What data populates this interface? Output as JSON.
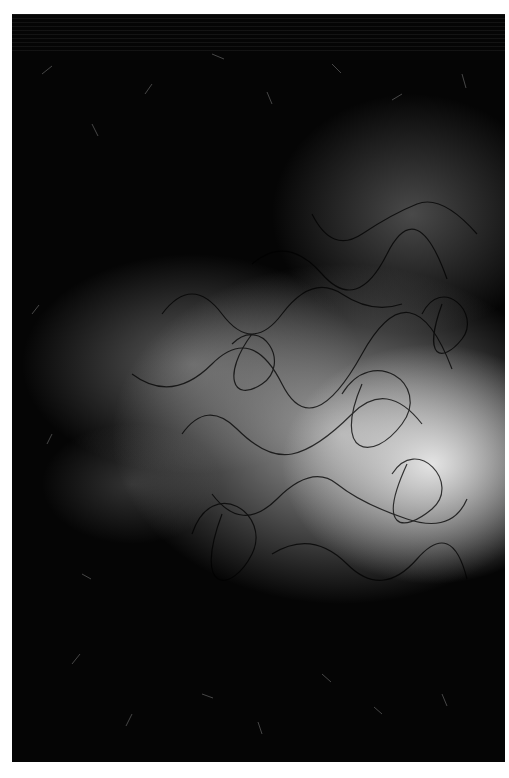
{
  "image": {
    "description": "Grayscale close-up photograph of dense dark curly fibers/hair over a softly lit textured surface, brightest toward the center-right",
    "frame_color": "#ffffff",
    "palette": {
      "dark": "#050505",
      "highlight": "#ebebeb",
      "midtone": "#9a9a9a"
    }
  }
}
